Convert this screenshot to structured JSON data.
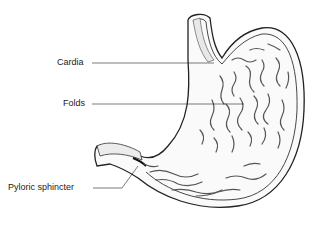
{
  "diagram": {
    "labels": [
      {
        "id": "cardia",
        "text": "Cardia"
      },
      {
        "id": "folds",
        "text": "Folds"
      },
      {
        "id": "pyloric-sphincter",
        "text": "Pyloric sphincter"
      }
    ],
    "colors": {
      "line": "#222222",
      "background": "#ffffff",
      "shade": "#888888"
    }
  }
}
